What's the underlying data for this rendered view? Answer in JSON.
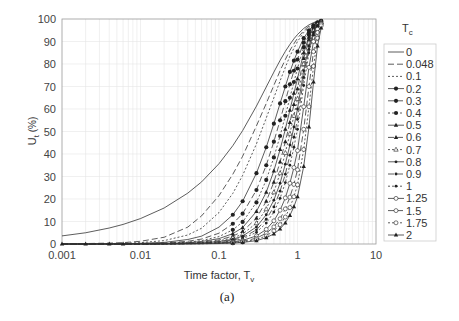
{
  "chart_data": {
    "type": "line",
    "title": "",
    "caption": "(a)",
    "xlabel": "Time factor, T",
    "xlabel_sub": "v",
    "ylabel": "U",
    "ylabel_sub": "t",
    "ylabel_suffix": " (%)",
    "xscale": "log",
    "xlim": [
      0.001,
      10
    ],
    "ylim": [
      0,
      100
    ],
    "xticks": [
      "0.001",
      "0.01",
      "0.1",
      "1",
      "10"
    ],
    "yticks": [
      "0",
      "10",
      "20",
      "30",
      "40",
      "50",
      "60",
      "70",
      "80",
      "90",
      "100"
    ],
    "grid": true,
    "legend_title": "T",
    "legend_title_sub": "c",
    "legend_position": "right",
    "x": [
      0.001,
      0.002,
      0.004,
      0.006,
      0.01,
      0.02,
      0.04,
      0.06,
      0.1,
      0.15,
      0.2,
      0.3,
      0.4,
      0.5,
      0.6,
      0.7,
      0.8,
      0.9,
      1.0,
      1.2,
      1.4,
      1.6,
      1.8,
      2.0
    ],
    "series": [
      {
        "name": "0",
        "dash": "",
        "marker": "none",
        "values": [
          3.6,
          5.0,
          7.1,
          8.7,
          11.3,
          16.0,
          22.6,
          27.6,
          35.7,
          43.7,
          50.4,
          61.3,
          69.8,
          76.4,
          81.6,
          85.6,
          88.7,
          91.2,
          93.1,
          95.8,
          97.4,
          98.4,
          99.0,
          99.4
        ]
      },
      {
        "name": "0.048",
        "dash": "6,3",
        "marker": "none",
        "values": [
          0.1,
          0.2,
          0.4,
          0.6,
          1.2,
          3.0,
          7.5,
          12.5,
          21.5,
          31.0,
          39.0,
          52.5,
          62.5,
          70.5,
          77.0,
          82.0,
          86.0,
          89.0,
          91.5,
          94.8,
          96.9,
          98.1,
          98.9,
          99.4
        ]
      },
      {
        "name": "0.1",
        "dash": "2,2",
        "marker": "none",
        "values": [
          0.0,
          0.1,
          0.2,
          0.3,
          0.6,
          1.5,
          4.0,
          7.0,
          14.0,
          22.5,
          30.5,
          44.5,
          56.0,
          65.0,
          72.5,
          78.5,
          83.5,
          87.0,
          90.0,
          94.0,
          96.3,
          97.8,
          98.7,
          99.3
        ]
      },
      {
        "name": "0.2",
        "dash": "",
        "marker": "dot",
        "values": [
          0.0,
          0.0,
          0.1,
          0.1,
          0.3,
          0.7,
          2.0,
          3.5,
          7.5,
          13.0,
          19.0,
          31.5,
          43.0,
          53.5,
          62.5,
          70.0,
          76.5,
          81.5,
          85.5,
          91.5,
          95.0,
          97.2,
          98.5,
          99.2
        ]
      },
      {
        "name": "0.3",
        "dash": "6,3",
        "marker": "dot",
        "values": [
          0.0,
          0.0,
          0.0,
          0.1,
          0.2,
          0.4,
          1.2,
          2.2,
          4.8,
          9.0,
          13.5,
          24.0,
          35.0,
          45.5,
          55.0,
          63.5,
          71.0,
          77.0,
          82.0,
          89.5,
          94.0,
          96.7,
          98.3,
          99.1
        ]
      },
      {
        "name": "0.4",
        "dash": "2,2",
        "marker": "dot",
        "values": [
          0.0,
          0.0,
          0.0,
          0.0,
          0.1,
          0.3,
          0.8,
          1.5,
          3.3,
          6.3,
          9.8,
          18.5,
          28.5,
          38.5,
          48.0,
          57.0,
          65.0,
          72.0,
          78.0,
          87.5,
          93.0,
          96.2,
          98.1,
          99.0
        ]
      },
      {
        "name": "0.5",
        "dash": "",
        "marker": "triangle",
        "values": [
          0.0,
          0.0,
          0.0,
          0.0,
          0.1,
          0.2,
          0.6,
          1.1,
          2.4,
          4.6,
          7.3,
          14.5,
          23.0,
          32.5,
          42.0,
          51.0,
          59.5,
          67.0,
          73.5,
          85.0,
          92.0,
          95.8,
          97.9,
          98.9
        ]
      },
      {
        "name": "0.6",
        "dash": "6,3",
        "marker": "triangle",
        "values": [
          0.0,
          0.0,
          0.0,
          0.0,
          0.1,
          0.2,
          0.4,
          0.8,
          1.8,
          3.5,
          5.6,
          11.5,
          19.0,
          27.5,
          36.5,
          45.5,
          54.0,
          62.0,
          69.0,
          82.5,
          90.8,
          95.3,
          97.7,
          98.8
        ]
      },
      {
        "name": "0.7",
        "dash": "2,2",
        "marker": "triangle-open",
        "values": [
          0.0,
          0.0,
          0.0,
          0.0,
          0.0,
          0.1,
          0.3,
          0.6,
          1.4,
          2.7,
          4.4,
          9.3,
          15.5,
          23.0,
          31.5,
          40.5,
          49.0,
          57.0,
          64.5,
          80.0,
          89.5,
          94.8,
          97.5,
          98.7
        ]
      },
      {
        "name": "0.8",
        "dash": "",
        "marker": "small-dot",
        "values": [
          0.0,
          0.0,
          0.0,
          0.0,
          0.0,
          0.1,
          0.2,
          0.5,
          1.1,
          2.1,
          3.5,
          7.6,
          13.0,
          19.5,
          27.0,
          35.5,
          44.0,
          52.0,
          60.0,
          77.0,
          88.0,
          94.2,
          97.2,
          98.6
        ]
      },
      {
        "name": "0.9",
        "dash": "6,3",
        "marker": "small-dot",
        "values": [
          0.0,
          0.0,
          0.0,
          0.0,
          0.0,
          0.1,
          0.2,
          0.4,
          0.9,
          1.7,
          2.8,
          6.3,
          11.0,
          16.5,
          23.5,
          31.0,
          39.5,
          47.5,
          55.5,
          74.0,
          86.5,
          93.5,
          96.9,
          98.5
        ]
      },
      {
        "name": "1",
        "dash": "2,2",
        "marker": "small-dot",
        "values": [
          0.0,
          0.0,
          0.0,
          0.0,
          0.0,
          0.1,
          0.2,
          0.3,
          0.7,
          1.4,
          2.3,
          5.2,
          9.3,
          14.2,
          20.3,
          27.3,
          35.0,
          43.0,
          51.0,
          70.5,
          85.0,
          92.8,
          96.6,
          98.4
        ]
      },
      {
        "name": "1.25",
        "dash": "",
        "marker": "circle-open",
        "values": [
          0.0,
          0.0,
          0.0,
          0.0,
          0.0,
          0.0,
          0.1,
          0.2,
          0.5,
          1.0,
          1.6,
          3.6,
          6.5,
          10.3,
          15.0,
          20.5,
          27.0,
          34.0,
          41.5,
          61.0,
          78.5,
          90.0,
          95.5,
          98.0
        ]
      },
      {
        "name": "1.5",
        "dash": "6,3",
        "marker": "circle-open",
        "values": [
          0.0,
          0.0,
          0.0,
          0.0,
          0.0,
          0.0,
          0.1,
          0.2,
          0.4,
          0.7,
          1.2,
          2.6,
          4.8,
          7.6,
          11.2,
          15.6,
          20.8,
          26.5,
          33.0,
          51.0,
          70.0,
          85.5,
          94.0,
          97.6
        ]
      },
      {
        "name": "1.75",
        "dash": "2,2",
        "marker": "circle-open",
        "values": [
          0.0,
          0.0,
          0.0,
          0.0,
          0.0,
          0.0,
          0.1,
          0.1,
          0.3,
          0.5,
          0.9,
          2.0,
          3.6,
          5.8,
          8.6,
          12.0,
          16.2,
          21.0,
          26.3,
          42.0,
          61.0,
          79.0,
          91.5,
          97.0
        ]
      },
      {
        "name": "2",
        "dash": "",
        "marker": "triangle",
        "values": [
          0.0,
          0.0,
          0.0,
          0.0,
          0.0,
          0.0,
          0.1,
          0.1,
          0.2,
          0.4,
          0.7,
          1.5,
          2.8,
          4.5,
          6.7,
          9.4,
          12.7,
          16.6,
          21.0,
          34.5,
          52.0,
          72.0,
          88.0,
          96.0
        ]
      }
    ]
  },
  "legend": {
    "title": "T",
    "title_sub": "c",
    "items": [
      "0",
      "0.048",
      "0.1",
      "0.2",
      "0.3",
      "0.4",
      "0.5",
      "0.6",
      "0.7",
      "0.8",
      "0.9",
      "1",
      "1.25",
      "1.5",
      "1.75",
      "2"
    ]
  }
}
